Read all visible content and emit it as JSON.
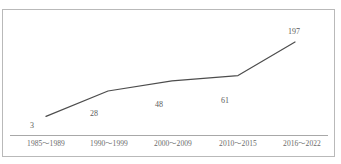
{
  "chart_data": {
    "type": "line",
    "title": "",
    "subtitle": "",
    "xlabel": "",
    "ylabel": "",
    "categories": [
      "1985〜1989",
      "1990〜1999",
      "2000〜2009",
      "2010〜2015",
      "2016〜2022"
    ],
    "values": [
      3,
      28,
      48,
      61,
      197
    ],
    "data_labels": [
      "3",
      "28",
      "48",
      "61",
      "197"
    ],
    "series": [
      {
        "name": "",
        "values": [
          3,
          28,
          48,
          61,
          197
        ]
      }
    ],
    "ylim": [
      0,
      197
    ],
    "grid": false,
    "legend": false,
    "legend_position": "none",
    "y_axis_visible": false,
    "x_axis_visible": true,
    "markers": false,
    "line_color": "#4d4d4d",
    "axis_color": "#a8a8a8",
    "frame_color": "#b9b9b9",
    "label_color": "#5c5c5c",
    "tick_color": "#6a6a6a",
    "background": "#ffffff"
  }
}
